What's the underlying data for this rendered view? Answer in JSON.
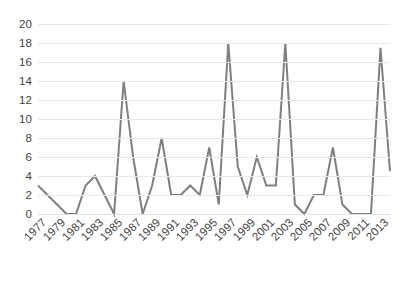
{
  "chart_data": {
    "type": "line",
    "title": "",
    "subtitle": "",
    "xlabel": "",
    "ylabel": "",
    "grid": "horizontal",
    "legend": "none",
    "line_color": "#7f7f7f",
    "line_width": 2,
    "background_color": "#ffffff",
    "gridline_color": "#e8e8e8",
    "tick_label_color": "#3f3f3f",
    "xlim": [
      "1977",
      "2014"
    ],
    "ylim": [
      0,
      20
    ],
    "ytick_step": 2,
    "ytick_labels": [
      "20",
      "18",
      "16",
      "14",
      "12",
      "10",
      "8",
      "6",
      "4",
      "2",
      "0"
    ],
    "ytick_values": [
      20,
      18,
      16,
      14,
      12,
      10,
      8,
      6,
      4,
      2,
      0
    ],
    "xtick_labels": [
      "1977",
      "1979",
      "1981",
      "1983",
      "1985",
      "1987",
      "1989",
      "1991",
      "1993",
      "1995",
      "1997",
      "1999",
      "2001",
      "2003",
      "2005",
      "2007",
      "2009",
      "2011",
      "2013"
    ],
    "xtick_rotation": -45,
    "x": [
      "1977",
      "1978",
      "1979",
      "1980",
      "1981",
      "1982",
      "1983",
      "1984",
      "1985",
      "1986",
      "1987",
      "1988",
      "1989",
      "1990",
      "1991",
      "1992",
      "1993",
      "1994",
      "1995",
      "1996",
      "1997",
      "1998",
      "1999",
      "2000",
      "2001",
      "2002",
      "2003",
      "2004",
      "2005",
      "2006",
      "2007",
      "2008",
      "2009",
      "2010",
      "2011",
      "2012",
      "2013",
      "2014"
    ],
    "values": [
      3,
      2,
      1,
      0,
      0,
      3,
      4,
      2,
      0,
      14,
      6,
      0,
      3,
      8,
      2,
      2,
      3,
      2,
      7,
      1,
      18,
      5,
      2,
      6,
      3,
      3,
      18,
      1,
      0,
      2,
      2,
      7,
      1,
      0,
      0,
      0,
      17.5,
      4.5
    ]
  }
}
